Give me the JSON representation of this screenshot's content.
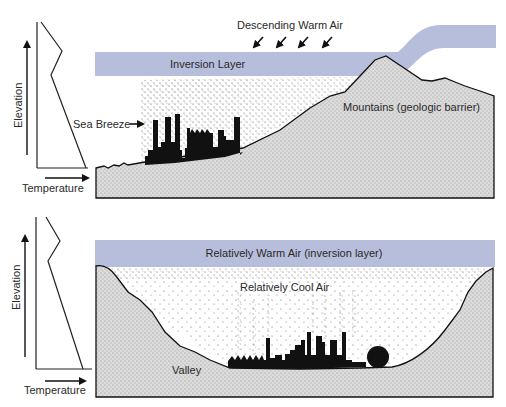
{
  "colors": {
    "inversion_band": "#b7bedc",
    "ground": "#d9d9d9",
    "ink": "#111111",
    "background": "#ffffff"
  },
  "top_panel": {
    "title": "Coastal inversion with mountain barrier",
    "profile": {
      "y_axis_label": "Elevation",
      "x_axis_label": "Temperature"
    },
    "labels": {
      "descending_air": "Descending Warm Air",
      "inversion_layer": "Inversion Layer",
      "sea_breeze": "Sea Breeze",
      "mountains": "Mountains (geologic barrier)"
    },
    "descending_arrow_count": 4
  },
  "bottom_panel": {
    "title": "Valley inversion",
    "profile": {
      "y_axis_label": "Elevation",
      "x_axis_label": "Temperature"
    },
    "labels": {
      "warm_air": "Relatively Warm Air (inversion layer)",
      "cool_air": "Relatively Cool Air",
      "valley": "Valley"
    }
  }
}
